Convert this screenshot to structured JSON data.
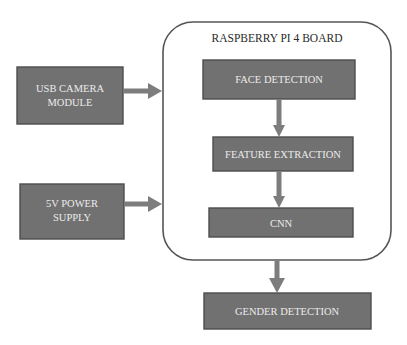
{
  "diagram": {
    "board": {
      "title": "RASPBERRY PI 4 BOARD"
    },
    "inputs": [
      {
        "id": "usb-camera",
        "lines": [
          "USB CAMERA",
          "MODULE"
        ]
      },
      {
        "id": "power-supply",
        "lines": [
          "5V POWER",
          "SUPPLY"
        ]
      }
    ],
    "pipeline": [
      {
        "id": "face-detection",
        "label": "FACE DETECTION"
      },
      {
        "id": "feature-extraction",
        "label": "FEATURE EXTRACTION"
      },
      {
        "id": "cnn",
        "label": "CNN"
      }
    ],
    "output": {
      "id": "gender-detection",
      "label": "GENDER DETECTION"
    },
    "edges": [
      {
        "from": "usb-camera",
        "to": "board"
      },
      {
        "from": "power-supply",
        "to": "board"
      },
      {
        "from": "face-detection",
        "to": "feature-extraction"
      },
      {
        "from": "feature-extraction",
        "to": "cnn"
      },
      {
        "from": "board",
        "to": "gender-detection"
      }
    ],
    "colors": {
      "box_fill": "#717171",
      "box_text": "#ececec",
      "arrow": "#7d7d7d",
      "board_outline": "#555555"
    }
  }
}
